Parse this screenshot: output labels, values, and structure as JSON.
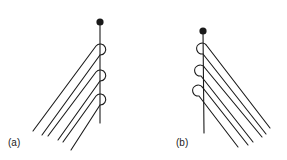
{
  "figure": {
    "panels": [
      {
        "id": "a",
        "label": "(a)",
        "description": "Vertical stem with knob at top; three hooked loops on right side of stem, with six parallel strands extending diagonally down-left",
        "loop_side": "right",
        "strand_direction": "down-left"
      },
      {
        "id": "b",
        "label": "(b)",
        "description": "Vertical stem with knob at top; three hooked loops on left side of stem, with six parallel strands extending diagonally down-right",
        "loop_side": "left",
        "strand_direction": "down-right"
      }
    ],
    "colors": {
      "stroke": "#1a1a1a",
      "background": "#ffffff"
    }
  }
}
